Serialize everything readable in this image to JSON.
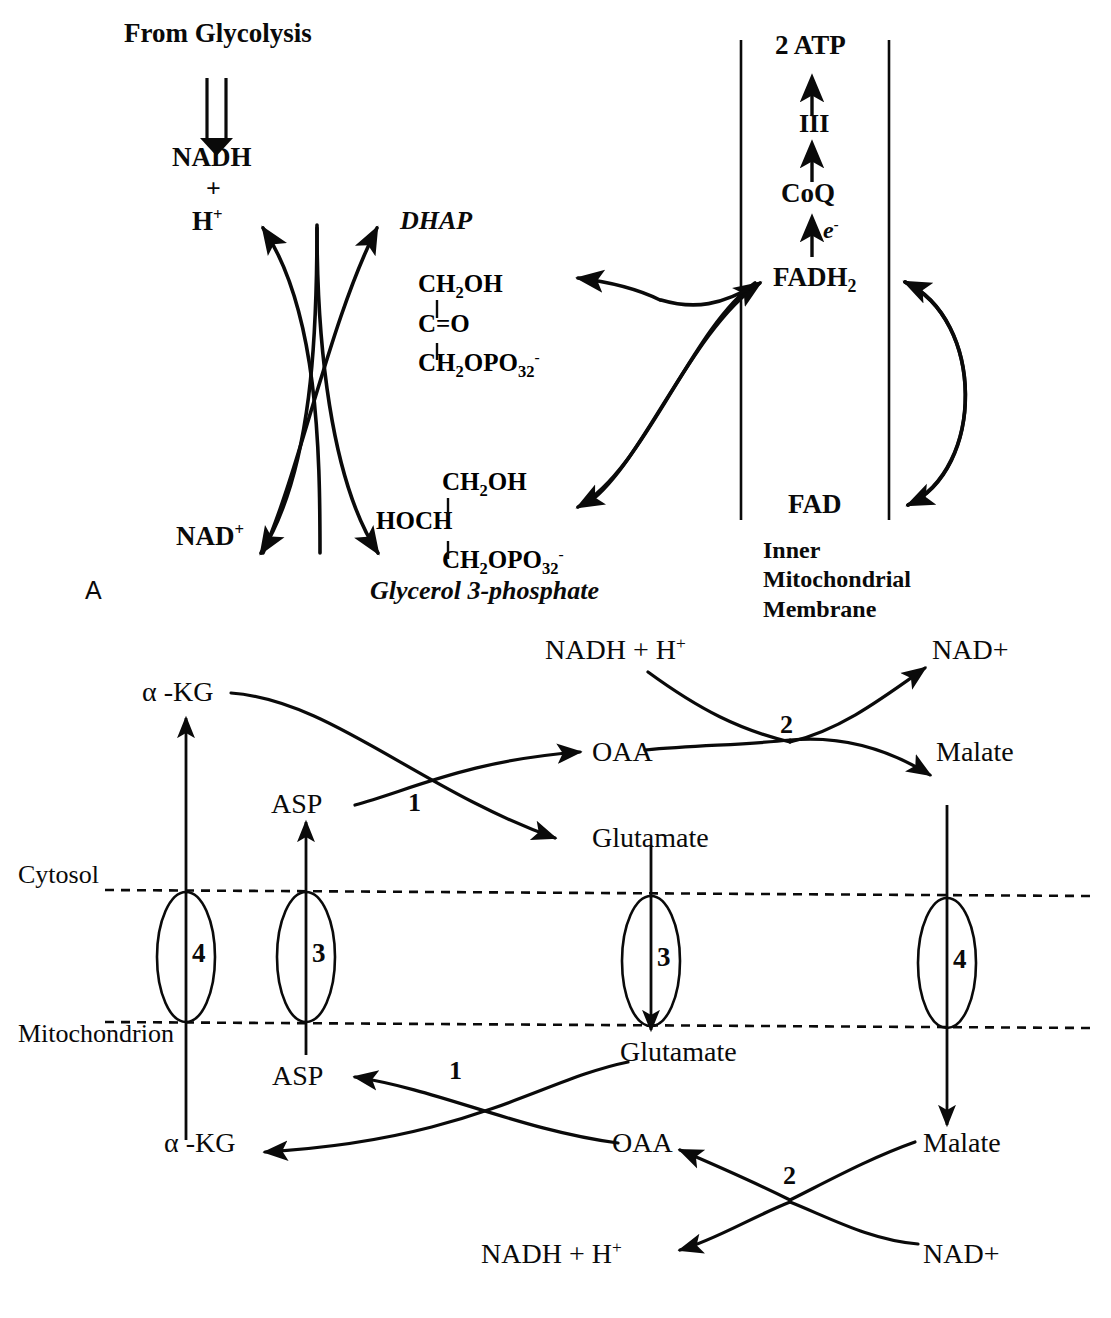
{
  "figure": {
    "panels": [
      "A",
      "B"
    ]
  },
  "panel_a": {
    "label": "A",
    "from_glycolysis": "From Glycolysis",
    "nadh": "NADH",
    "plus": "+",
    "h_plus": "H",
    "h_plus_charge": "+",
    "nad_plus": "NAD",
    "nad_plus_charge": "+",
    "dhap_name": "DHAP",
    "dhap_structure": [
      "CH2OH",
      "C=O",
      "CH2OPO32-"
    ],
    "dhap_line1_main": "CH",
    "dhap_line1_sub": "2",
    "dhap_line1_rest": "OH",
    "dhap_line2": "C=O",
    "dhap_line3_main": "CH",
    "dhap_line3_sub": "2",
    "dhap_line3_mid": "OPO",
    "dhap_line3_sub2": "3",
    "dhap_line3_sub3": "2",
    "dhap_line3_charge": "-",
    "g3p_name": "Glycerol 3-phosphate",
    "g3p_line1_main": "CH",
    "g3p_line1_sub": "2",
    "g3p_line1_rest": "OH",
    "g3p_line2": "HOCH",
    "g3p_line3_main": "CH",
    "g3p_line3_sub": "2",
    "g3p_line3_mid": "OPO",
    "g3p_line3_sub2": "3",
    "g3p_line3_sub3": "2",
    "g3p_line3_charge": "-",
    "atp": "2 ATP",
    "complex_iii": "III",
    "coq": "CoQ",
    "electron": "e",
    "electron_charge": "-",
    "fadh2_main": "FADH",
    "fadh2_sub": "2",
    "fad": "FAD",
    "membrane_label_lines": [
      "Inner",
      "Mitochondrial",
      "Membrane"
    ]
  },
  "panel_b": {
    "cytosol": "Cytosol",
    "mitochondrion": "Mitochondrion",
    "alpha": "α",
    "akg_top": "α -KG",
    "akg_bottom": "α -KG",
    "asp_top": "ASP",
    "asp_bottom": "ASP",
    "oaa_top": "OAA",
    "oaa_bottom": "OAA",
    "glutamate_top": "Glutamate",
    "glutamate_bottom": "Glutamate",
    "malate_top": "Malate",
    "malate_bottom": "Malate",
    "nadh_h_top_main": "NADH  + H",
    "nadh_h_top_charge": "+",
    "nadh_h_bottom_main": "NADH + H",
    "nadh_h_bottom_charge": "+",
    "nad_top": "NAD+",
    "nad_bottom": "NAD+",
    "enzyme_1_top": "1",
    "enzyme_2_top": "2",
    "enzyme_1_bottom": "1",
    "enzyme_2_bottom": "2",
    "transporter_4_left": "4",
    "transporter_3_left": "3",
    "transporter_3_right": "3",
    "transporter_4_right": "4"
  },
  "colors": {
    "ink": "#0a0a0a",
    "background": "#ffffff"
  }
}
